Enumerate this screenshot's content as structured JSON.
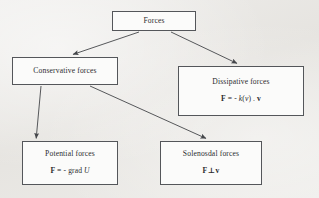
{
  "diagram": {
    "kind": "flowchart",
    "background_color": "#eceae7",
    "box_fill_color": "#fbfbfa",
    "box_border_color": "#54565a",
    "text_color": "#2b2c2e",
    "nodes": [
      {
        "id": "forces",
        "title": "Forces",
        "formula": "",
        "box": {
          "x": 112,
          "y": 11,
          "w": 84,
          "h": 20
        }
      },
      {
        "id": "conservative",
        "title": "Conservative forces",
        "formula": "",
        "box": {
          "x": 12,
          "y": 57,
          "w": 106,
          "h": 28
        }
      },
      {
        "id": "dissipative",
        "title": "Dissipative forces",
        "formula": "F = - k( v ) . v",
        "box": {
          "x": 178,
          "y": 66,
          "w": 126,
          "h": 50
        }
      },
      {
        "id": "potential",
        "title": "Potential forces",
        "formula": "F = - grad U",
        "box": {
          "x": 22,
          "y": 141,
          "w": 96,
          "h": 44
        }
      },
      {
        "id": "solenoidal",
        "title": "Solenosdal forces",
        "formula": "F ⊥ v",
        "box": {
          "x": 160,
          "y": 141,
          "w": 102,
          "h": 44
        }
      }
    ],
    "edges": [
      {
        "id": "forces-to-conservative",
        "from": "forces",
        "to": "conservative",
        "x1": 139,
        "y1": 32,
        "x2": 72,
        "y2": 55
      },
      {
        "id": "forces-to-dissipative",
        "from": "forces",
        "to": "dissipative",
        "x1": 171,
        "y1": 32,
        "x2": 238,
        "y2": 64
      },
      {
        "id": "conservative-to-potential",
        "from": "conservative",
        "to": "potential",
        "x1": 41,
        "y1": 86,
        "x2": 36,
        "y2": 139
      },
      {
        "id": "conservative-to-solenoidal",
        "from": "conservative",
        "to": "solenoidal",
        "x1": 90,
        "y1": 86,
        "x2": 207,
        "y2": 139
      }
    ]
  },
  "formula_parts": {
    "dissipative": {
      "lhs": "F",
      "eq": " = - ",
      "k": "k",
      "open": "(",
      "v_arg": "v",
      "close": ")",
      "dot": " . ",
      "rhs": "v"
    },
    "potential": {
      "lhs": "F",
      "eq": " = - grad ",
      "rhs": "U"
    },
    "solenoidal": {
      "lhs": "F",
      "op": "⊥",
      "rhs": "v"
    }
  }
}
